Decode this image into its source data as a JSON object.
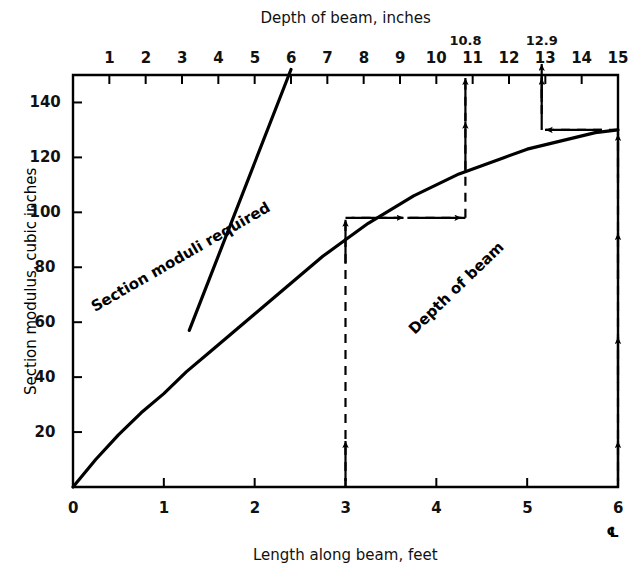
{
  "figure": {
    "top_axis_title": "Depth of beam, inches",
    "bottom_axis_title": "Length along beam, feet",
    "left_axis_title": "Section modulus, cubic inches",
    "centerline_symbol": "℄",
    "curve_labels": {
      "section_moduli": "Section moduli required",
      "depth_of_beam": "Depth of beam"
    },
    "callouts": {
      "depth_1": "10.8",
      "depth_2": "12.9"
    }
  },
  "chart_data": {
    "type": "line",
    "title": "",
    "xlabel": "Length along beam, feet",
    "ylabel": "Section modulus, cubic inches",
    "xlabel_top": "Depth of beam, inches",
    "xlim": [
      0,
      6
    ],
    "ylim": [
      0,
      150
    ],
    "xlim_top": [
      0,
      15
    ],
    "grid": false,
    "legend": "none",
    "x_ticks": [
      0,
      1,
      2,
      3,
      4,
      5,
      6
    ],
    "x_tick_labels": [
      "0",
      "1",
      "2",
      "3",
      "4",
      "5",
      "6"
    ],
    "y_ticks": [
      0,
      20,
      40,
      60,
      80,
      100,
      120,
      140
    ],
    "y_tick_labels": [
      "0",
      "20",
      "40",
      "60",
      "80",
      "100",
      "120",
      "140"
    ],
    "x_ticks_top": [
      1,
      2,
      3,
      4,
      5,
      6,
      7,
      8,
      9,
      10,
      11,
      12,
      13,
      14,
      15
    ],
    "x_tick_labels_top": [
      "1",
      "2",
      "3",
      "4",
      "5",
      "6",
      "7",
      "8",
      "9",
      "10",
      "11",
      "12",
      "13",
      "14",
      "15"
    ],
    "series": [
      {
        "name": "Section moduli required",
        "axis": "bottom",
        "points": [
          [
            0.0,
            0
          ],
          [
            0.25,
            10
          ],
          [
            0.5,
            19
          ],
          [
            0.75,
            27
          ],
          [
            1.0,
            34
          ],
          [
            1.25,
            42
          ],
          [
            1.5,
            49
          ],
          [
            1.75,
            56
          ],
          [
            2.0,
            63
          ],
          [
            2.25,
            70
          ],
          [
            2.5,
            77
          ],
          [
            2.75,
            84
          ],
          [
            3.0,
            90
          ],
          [
            3.25,
            96
          ],
          [
            3.5,
            101
          ],
          [
            3.75,
            106
          ],
          [
            4.0,
            110
          ],
          [
            4.25,
            114
          ],
          [
            4.5,
            117
          ],
          [
            4.75,
            120
          ],
          [
            5.0,
            123
          ],
          [
            5.25,
            125
          ],
          [
            5.5,
            127
          ],
          [
            5.75,
            129
          ],
          [
            6.0,
            130
          ]
        ]
      },
      {
        "name": "Depth of beam",
        "axis": "top",
        "points": [
          [
            3.2,
            57
          ],
          [
            6.0,
            152
          ]
        ]
      }
    ],
    "annotations": [
      {
        "label": "10.8",
        "type": "depth-readout",
        "x_top": 10.8,
        "from_y": 98,
        "to_y": 150
      },
      {
        "label": "12.9",
        "type": "depth-readout",
        "x_top": 12.9,
        "from_y": 130,
        "to_y": 150
      },
      {
        "label": "",
        "type": "vertical-guide",
        "x_bottom": 3,
        "y_value": 98
      },
      {
        "label": "",
        "type": "horizontal-guide",
        "y_value": 98,
        "x_from": 3,
        "x_to_top": 10.8
      },
      {
        "label": "",
        "type": "vertical-guide",
        "x_bottom": 6,
        "y_value": 130
      },
      {
        "label": "",
        "type": "horizontal-guide",
        "y_value": 130,
        "x_from": 6,
        "x_to_top": 12.9
      }
    ]
  }
}
